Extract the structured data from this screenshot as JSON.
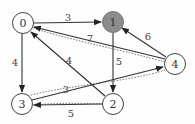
{
  "graph": {
    "nodes": [
      {
        "id": "0",
        "label": "0",
        "x": 23,
        "y": 23,
        "highlighted": false
      },
      {
        "id": "1",
        "label": "1",
        "x": 113,
        "y": 22,
        "highlighted": true
      },
      {
        "id": "2",
        "label": "2",
        "x": 113,
        "y": 104,
        "highlighted": false
      },
      {
        "id": "3",
        "label": "3",
        "x": 22,
        "y": 104,
        "highlighted": false
      },
      {
        "id": "4",
        "label": "4",
        "x": 175,
        "y": 64,
        "highlighted": false
      }
    ],
    "edges": [
      {
        "from": "0",
        "to": "1",
        "weight": "3",
        "style": "solid"
      },
      {
        "from": "0",
        "to": "3",
        "weight": "4",
        "style": "solid"
      },
      {
        "from": "1",
        "to": "2",
        "weight": "5",
        "style": "solid"
      },
      {
        "from": "2",
        "to": "0",
        "weight": "4",
        "style": "solid"
      },
      {
        "from": "4",
        "to": "0",
        "weight": "7",
        "style": "solid"
      },
      {
        "from": "4",
        "to": "1",
        "weight": "6",
        "style": "solid"
      },
      {
        "from": "3",
        "to": "4",
        "weight": "3",
        "style": "solid"
      },
      {
        "from": "2",
        "to": "3",
        "weight": "5",
        "style": "solid"
      },
      {
        "from": "4",
        "to": "0",
        "weight": "",
        "style": "dotted"
      },
      {
        "from": "3",
        "to": "4",
        "weight": "",
        "style": "dotted"
      },
      {
        "from": "2",
        "to": "3",
        "weight": "",
        "style": "dotted"
      }
    ],
    "weights": {
      "w01": "3",
      "w03": "4",
      "w12": "5",
      "w20": "4",
      "w40": "7",
      "w41": "6",
      "w34": "3",
      "w23": "5"
    },
    "colors": {
      "highlight_fill": "#8c8c8c",
      "stroke": "#333333"
    }
  }
}
